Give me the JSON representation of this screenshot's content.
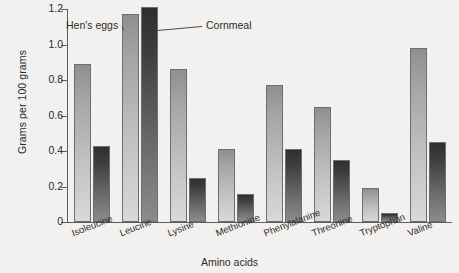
{
  "chart_data": {
    "type": "bar",
    "title": "",
    "xlabel": "Amino acids",
    "ylabel": "Grams per 100 grams",
    "categories": [
      "Isoleucine",
      "Leucine",
      "Lysine",
      "Methionine",
      "Phenylalanine",
      "Threonine",
      "Tryptophan",
      "Valine"
    ],
    "series": [
      {
        "name": "Hen's eggs",
        "color": "#b4b4b4",
        "values": [
          0.89,
          1.17,
          0.86,
          0.41,
          0.77,
          0.65,
          0.19,
          0.98
        ]
      },
      {
        "name": "Cornmeal",
        "color": "#3d3d3d",
        "values": [
          0.43,
          1.21,
          0.25,
          0.16,
          0.41,
          0.35,
          0.05,
          0.45
        ]
      }
    ],
    "ylim": [
      0,
      1.2
    ],
    "ytick_labels": [
      "1.2",
      "1.0",
      "0.8",
      "0.6",
      "0.4",
      "0.2",
      "0"
    ],
    "ytick_values": [
      1.2,
      1.0,
      0.8,
      0.6,
      0.4,
      0.2,
      0
    ],
    "grid": false,
    "legend_position": "inline-annotations",
    "annotations": [
      {
        "text": "Hen's eggs",
        "target_series": "Hen's eggs"
      },
      {
        "text": "Cornmeal",
        "target_series": "Cornmeal"
      }
    ]
  },
  "background_color": "#f3f1ef"
}
